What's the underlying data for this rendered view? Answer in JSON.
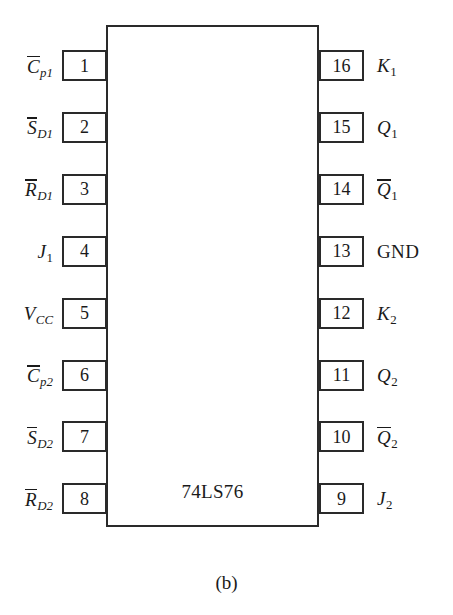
{
  "figure": {
    "caption": "(b)",
    "chip_name": "74LS76",
    "colors": {
      "outline": "#2a2a2a",
      "background": "#ffffff",
      "text": "#1a1a1a"
    }
  },
  "pins": {
    "left": [
      {
        "number": "1",
        "label_base": "C",
        "label_sub": "p1",
        "overline": true,
        "upright": false
      },
      {
        "number": "2",
        "label_base": "S",
        "label_sub": "D1",
        "overline": true,
        "upright": false
      },
      {
        "number": "3",
        "label_base": "R",
        "label_sub": "D1",
        "overline": true,
        "upright": false
      },
      {
        "number": "4",
        "label_base": "J",
        "label_sub": "1",
        "overline": false,
        "upright": false
      },
      {
        "number": "5",
        "label_base": "V",
        "label_sub": "CC",
        "overline": false,
        "upright": false
      },
      {
        "number": "6",
        "label_base": "C",
        "label_sub": "p2",
        "overline": true,
        "upright": false
      },
      {
        "number": "7",
        "label_base": "S",
        "label_sub": "D2",
        "overline": true,
        "upright": false
      },
      {
        "number": "8",
        "label_base": "R",
        "label_sub": "D2",
        "overline": true,
        "upright": false
      }
    ],
    "right": [
      {
        "number": "16",
        "label_base": "K",
        "label_sub": "1",
        "overline": false,
        "upright": false
      },
      {
        "number": "15",
        "label_base": "Q",
        "label_sub": "1",
        "overline": false,
        "upright": false
      },
      {
        "number": "14",
        "label_base": "Q",
        "label_sub": "1",
        "overline": true,
        "upright": false
      },
      {
        "number": "13",
        "label_base": "GND",
        "label_sub": "",
        "overline": false,
        "upright": true
      },
      {
        "number": "12",
        "label_base": "K",
        "label_sub": "2",
        "overline": false,
        "upright": false
      },
      {
        "number": "11",
        "label_base": "Q",
        "label_sub": "2",
        "overline": false,
        "upright": false
      },
      {
        "number": "10",
        "label_base": "Q",
        "label_sub": "2",
        "overline": true,
        "upright": false
      },
      {
        "number": "9",
        "label_base": "J",
        "label_sub": "2",
        "overline": false,
        "upright": false
      }
    ]
  }
}
